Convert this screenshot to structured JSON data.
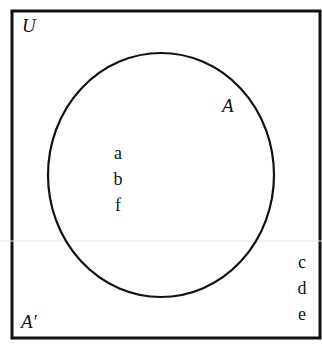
{
  "diagram": {
    "type": "venn",
    "universe_label": "U",
    "set_label": "A",
    "complement_label": "A′",
    "set_elements": [
      "a",
      "b",
      "f"
    ],
    "complement_elements": [
      "c",
      "d",
      "e"
    ],
    "colors": {
      "stroke": "#111111",
      "background": "#ffffff"
    }
  }
}
